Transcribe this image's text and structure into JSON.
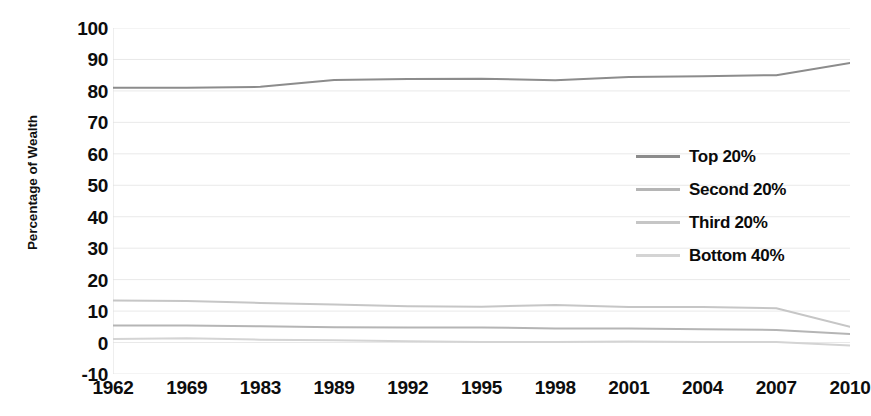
{
  "chart_data": {
    "type": "line",
    "title": "",
    "xlabel": "",
    "ylabel": "Percentage of Wealth",
    "categories": [
      "1962",
      "1969",
      "1983",
      "1989",
      "1992",
      "1995",
      "1998",
      "2001",
      "2004",
      "2007",
      "2010"
    ],
    "ylim": [
      -10,
      100
    ],
    "yticks": [
      100,
      90,
      80,
      70,
      60,
      50,
      40,
      30,
      20,
      10,
      0,
      -10
    ],
    "grid": true,
    "legend_position": "center-right",
    "series": [
      {
        "name": "Top 20%",
        "color": "#8c8c8c",
        "values": [
          81.0,
          81.0,
          81.3,
          83.5,
          83.8,
          83.9,
          83.4,
          84.4,
          84.7,
          85.0,
          88.9
        ]
      },
      {
        "name": "Second 20%",
        "color": "#b5b5b5",
        "values": [
          5.4,
          5.4,
          5.2,
          4.9,
          4.8,
          4.8,
          4.5,
          4.5,
          4.2,
          4.0,
          2.7
        ]
      },
      {
        "name": "Third 20%",
        "color": "#c6c6c6",
        "values": [
          13.4,
          13.2,
          12.6,
          12.1,
          11.5,
          11.4,
          11.9,
          11.3,
          11.3,
          10.9,
          5.0
        ]
      },
      {
        "name": "Bottom 40%",
        "color": "#d4d4d4",
        "values": [
          1.1,
          1.4,
          0.9,
          0.7,
          0.4,
          0.2,
          0.2,
          0.3,
          0.2,
          0.2,
          -0.9
        ]
      }
    ]
  },
  "legend": {
    "items": [
      {
        "label": "Top 20%"
      },
      {
        "label": "Second 20%"
      },
      {
        "label": "Third 20%"
      },
      {
        "label": "Bottom 40%"
      }
    ]
  }
}
